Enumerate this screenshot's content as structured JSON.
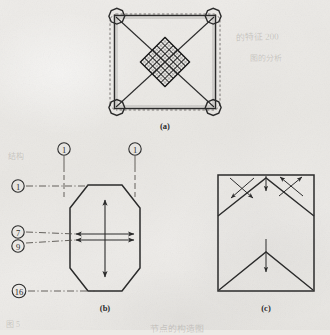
{
  "figure": {
    "background_color": "#eceae6",
    "ink_color": "#2b2b2b",
    "panels": [
      {
        "id": "panel-a",
        "caption": "(a)",
        "description": "square frame with octagonal corner nodes, diagonal bracing and a central rotated mesh grid",
        "mesh_rows": 6,
        "mesh_cols": 6
      },
      {
        "id": "panel-b",
        "caption": "(b)",
        "description": "octagonal section with vertical and horizontal double-headed arrows and numbered balloon callouts"
      },
      {
        "id": "panel-c",
        "caption": "(c)",
        "description": "rectangular section with chevron fold lines and directional arrows"
      }
    ],
    "callouts": [
      {
        "id": "callout-top-left",
        "label": "1",
        "panel": "panel-b",
        "position": "top-left"
      },
      {
        "id": "callout-top-right",
        "label": "1",
        "panel": "panel-b",
        "position": "top-right"
      },
      {
        "id": "callout-left-1",
        "label": "1",
        "panel": "panel-b",
        "position": "left-upper"
      },
      {
        "id": "callout-left-7",
        "label": "7",
        "panel": "panel-b",
        "position": "left-middle-upper"
      },
      {
        "id": "callout-left-9",
        "label": "9",
        "panel": "panel-b",
        "position": "left-middle-lower"
      },
      {
        "id": "callout-left-16",
        "label": "16",
        "panel": "panel-b",
        "position": "left-lower"
      }
    ],
    "ghost_text": [
      {
        "id": "ghost-top-right",
        "text": "的特征 200",
        "x": 236,
        "y": 30,
        "size": 9,
        "rotate": -2
      },
      {
        "id": "ghost-mid-right",
        "text": "图的分析",
        "x": 250,
        "y": 52,
        "size": 8,
        "rotate": -1
      },
      {
        "id": "ghost-mid-left",
        "text": "结构",
        "x": 8,
        "y": 150,
        "size": 8,
        "rotate": 0
      },
      {
        "id": "ghost-bottom",
        "text": "节点的构造图",
        "x": 150,
        "y": 322,
        "size": 9,
        "rotate": -1
      },
      {
        "id": "ghost-bottom-left",
        "text": "图 5",
        "x": 6,
        "y": 318,
        "size": 8,
        "rotate": 0
      }
    ]
  }
}
